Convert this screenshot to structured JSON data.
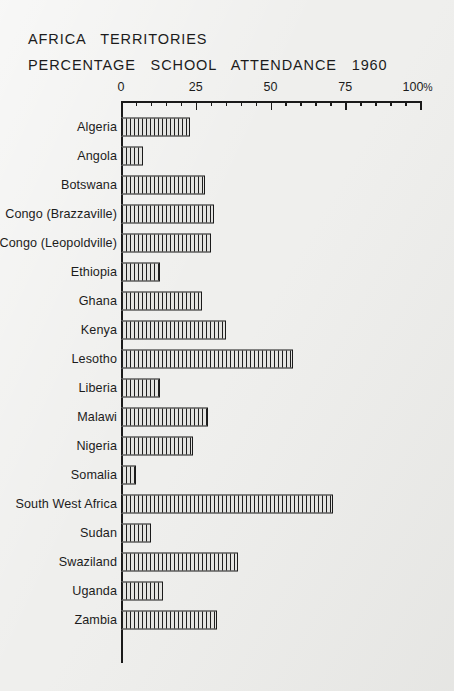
{
  "title": {
    "line1": "AFRICA   TERRITORIES",
    "line2": "PERCENTAGE   SCHOOL   ATTENDANCE   1960"
  },
  "axis": {
    "tick_labels": [
      "0",
      "25",
      "50",
      "75",
      "100"
    ],
    "percent_symbol": "%",
    "min": 0,
    "max": 100,
    "major_step": 25,
    "minor_step": 5
  },
  "chart_data": {
    "type": "bar",
    "orientation": "horizontal",
    "title": "AFRICA TERRITORIES PERCENTAGE SCHOOL ATTENDANCE 1960",
    "xlabel": "",
    "ylabel": "",
    "xlim": [
      0,
      100
    ],
    "grid": false,
    "legend": null,
    "units": "percent",
    "categories": [
      "Algeria",
      "Angola",
      "Botswana",
      "Congo (Brazzaville)",
      "Congo (Leopoldville)",
      "Ethiopia",
      "Ghana",
      "Kenya",
      "Lesotho",
      "Liberia",
      "Malawi",
      "Nigeria",
      "Somalia",
      "South West  Africa",
      "Sudan",
      "Swaziland",
      "Uganda",
      "Zambia"
    ],
    "values": [
      23,
      7.5,
      28,
      31,
      30,
      13,
      27,
      35,
      57.5,
      13,
      29,
      24,
      5,
      71,
      10,
      39,
      14,
      32
    ]
  }
}
